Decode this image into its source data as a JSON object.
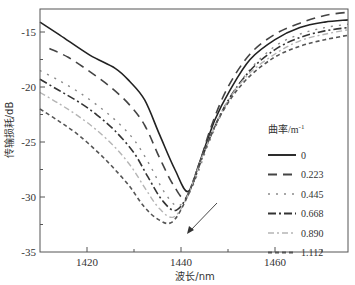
{
  "chart_data": {
    "type": "line",
    "title": "",
    "xlabel": "波长/nm",
    "ylabel": "传输损耗/dB",
    "xlim": [
      1410,
      1475.6
    ],
    "ylim": [
      -35,
      -12.9
    ],
    "xticks": [
      1420,
      1440,
      1460
    ],
    "yticks": [
      -15,
      -20,
      -25,
      -30,
      -35
    ],
    "grid": false,
    "legend_title": "曲率/m⁻¹",
    "legend_position": "right-middle",
    "annotation": "arrow pointing down-left near minima (increasing curvature shifts dip to shorter wavelength)",
    "series": [
      {
        "name": "0",
        "style": "solid",
        "color": "#222222",
        "x": [
          1410,
          1414.3,
          1420.6,
          1426,
          1429.1,
          1432.3,
          1435.5,
          1438.7,
          1441.5,
          1444,
          1447.2,
          1450.4,
          1454.7,
          1460,
          1465.3,
          1470.6,
          1475.5
        ],
        "y": [
          -14.1,
          -15.3,
          -17.1,
          -18.3,
          -19.5,
          -21.2,
          -24.4,
          -27.5,
          -29.5,
          -26.8,
          -23.0,
          -20.3,
          -17.5,
          -15.7,
          -14.6,
          -14.1,
          -13.9
        ]
      },
      {
        "name": "0.223",
        "style": "longdash",
        "color": "#444444",
        "x": [
          1412,
          1416,
          1420.6,
          1425,
          1429,
          1432.3,
          1435.5,
          1438.5,
          1441,
          1443.5,
          1446.5,
          1450,
          1454.7,
          1460,
          1465.3,
          1470.6,
          1475.5
        ],
        "y": [
          -16.5,
          -17.3,
          -18.6,
          -20.0,
          -21.6,
          -23.5,
          -26.5,
          -29.0,
          -30.1,
          -27.5,
          -23.5,
          -20.0,
          -17.0,
          -15.2,
          -14.2,
          -13.5,
          -13.2
        ]
      },
      {
        "name": "0.445",
        "style": "dotted",
        "color": "#8a8a8a",
        "x": [
          1410,
          1414,
          1418,
          1422,
          1426,
          1430,
          1433.5,
          1436.5,
          1439.5,
          1442.5,
          1446,
          1450,
          1454.7,
          1460,
          1465.3,
          1470.6,
          1475.5
        ],
        "y": [
          -18.5,
          -19.4,
          -20.4,
          -21.6,
          -23.0,
          -24.8,
          -27.2,
          -29.6,
          -30.8,
          -29.0,
          -25.0,
          -21.3,
          -18.4,
          -16.3,
          -15.2,
          -14.6,
          -14.3
        ]
      },
      {
        "name": "0.668",
        "style": "dashdot",
        "color": "#333333",
        "x": [
          1410,
          1414,
          1418,
          1422,
          1426,
          1430,
          1433,
          1436,
          1439,
          1442,
          1445.5,
          1449.5,
          1454.5,
          1460,
          1465.3,
          1470.6,
          1475.5
        ],
        "y": [
          -19.3,
          -20.3,
          -21.3,
          -22.5,
          -24.0,
          -26.0,
          -28.2,
          -30.3,
          -31.2,
          -29.3,
          -25.3,
          -21.6,
          -18.6,
          -16.6,
          -15.5,
          -14.9,
          -14.6
        ]
      },
      {
        "name": "0.890",
        "style": "dashdotlight",
        "color": "#b5b5b5",
        "x": [
          1410,
          1414,
          1418,
          1422,
          1426,
          1429.5,
          1432.5,
          1435.5,
          1438.5,
          1441.5,
          1445,
          1449,
          1454,
          1460,
          1465.3,
          1470.6,
          1475.5
        ],
        "y": [
          -20.5,
          -21.5,
          -22.6,
          -23.9,
          -25.5,
          -27.3,
          -29.3,
          -31.1,
          -31.8,
          -29.8,
          -25.8,
          -22.0,
          -19.0,
          -17.0,
          -15.8,
          -15.2,
          -14.8
        ]
      },
      {
        "name": "1.112",
        "style": "shortdash",
        "color": "#555555",
        "x": [
          1410,
          1414,
          1418,
          1422,
          1425.5,
          1429,
          1432,
          1435,
          1438,
          1441,
          1444.5,
          1448.5,
          1453.5,
          1459.5,
          1465.3,
          1470.6,
          1475.5
        ],
        "y": [
          -22.0,
          -23.1,
          -24.3,
          -25.8,
          -27.3,
          -29.0,
          -30.8,
          -32.0,
          -32.3,
          -30.3,
          -26.3,
          -22.5,
          -19.5,
          -17.4,
          -16.3,
          -15.7,
          -15.3
        ]
      }
    ]
  },
  "legend": {
    "title": "曲率/m",
    "title_sup": "-1",
    "items": [
      "0",
      "0.223",
      "0.445",
      "0.668",
      "0.890",
      "1.112"
    ]
  },
  "axes": {
    "xlabel": "波长/nm",
    "ylabel": "传输损耗/dB",
    "xtick_labels": [
      "1420",
      "1440",
      "1460"
    ],
    "ytick_labels": [
      "-15",
      "-20",
      "-25",
      "-30",
      "-35"
    ]
  }
}
